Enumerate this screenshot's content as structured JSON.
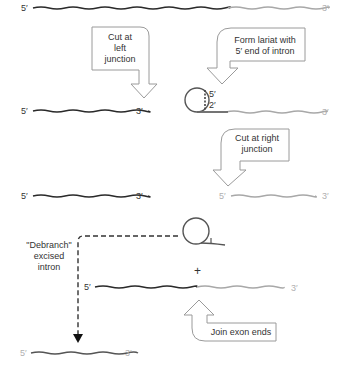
{
  "colors": {
    "exon_left": "#2a2a2a",
    "exon_right": "#a8a8a8",
    "intron": "#555555",
    "arrow_outline": "#9a9a9a",
    "text": "#333333"
  },
  "labels": {
    "five_prime": "5′",
    "three_prime": "3′",
    "two_prime": "2′",
    "plus": "+"
  },
  "steps": {
    "cut_left": "Cut at\nleft\njunction",
    "form_lariat": "Form lariat with\n5′ end of intron",
    "cut_right": "Cut at right\njunction",
    "debranch": "\"Debranch\"\nexcised\nintron",
    "join_exons": "Join exon ends"
  },
  "steps_lines": {
    "cut_left": [
      "Cut at",
      "left",
      "junction"
    ],
    "form_lariat": [
      "Form lariat with",
      "5′ end of intron"
    ],
    "cut_right": [
      "Cut at right",
      "junction"
    ],
    "debranch": [
      "\"Debranch\"",
      "excised",
      "intron"
    ],
    "join_exons": [
      "Join exon ends"
    ]
  }
}
